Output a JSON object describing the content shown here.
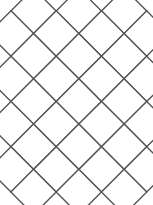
{
  "figure": {
    "title": "Diagonal diamond lattice tiling on a rectangle",
    "type": "geometric-diagram",
    "caption": "",
    "width": 153,
    "height": 205,
    "background_color": "#ffffff"
  },
  "colors": {
    "tile_fill": "#ffffff",
    "field_fill": "#d6d6d4",
    "stroke": "#555553",
    "outline": "#4a4a48",
    "page_background": "#ffffff"
  },
  "geometry": {
    "rect": {
      "x": 11,
      "y": 11,
      "width": 131,
      "height": 181
    },
    "lattice": {
      "pitch": 45.3,
      "half": 22.65,
      "rotation_deg": 45,
      "origin_x": 33.5,
      "origin_y": 33.5,
      "columns": 3,
      "rows": 4,
      "stroke_width": 1.4
    },
    "outline_stroke_width": 1.6
  },
  "chart_data": {
    "type": "diagram",
    "title": "Diagonal diamond lattice tiling on a rectangle",
    "shape": "rectangle",
    "tiling": "square tiles rotated 45 degrees",
    "tile_pitch_px": 45.3,
    "tile_side_px": 32,
    "full_tiles_interior": 6,
    "edge_notch_counts": {
      "top": 3,
      "bottom": 3,
      "left": 4,
      "right": 4
    },
    "fill_legend": [
      {
        "name": "tile",
        "color": "#ffffff",
        "label": "white diamond tile"
      },
      {
        "name": "field",
        "color": "#d6d6d4",
        "label": "gray background field"
      }
    ],
    "grid": false,
    "legend_position": "none",
    "annotations": []
  },
  "tiles": [
    {
      "cx": 33.5,
      "cy": 11.0
    },
    {
      "cx": 78.8,
      "cy": 11.0
    },
    {
      "cx": 124.1,
      "cy": 11.0
    },
    {
      "cx": 11.0,
      "cy": 33.5
    },
    {
      "cx": 56.2,
      "cy": 33.5
    },
    {
      "cx": 101.5,
      "cy": 33.5
    },
    {
      "cx": 146.7,
      "cy": 33.5
    },
    {
      "cx": 33.5,
      "cy": 56.2
    },
    {
      "cx": 78.8,
      "cy": 56.2
    },
    {
      "cx": 124.1,
      "cy": 56.2
    },
    {
      "cx": 11.0,
      "cy": 78.8
    },
    {
      "cx": 56.2,
      "cy": 78.8
    },
    {
      "cx": 101.5,
      "cy": 78.8
    },
    {
      "cx": 146.7,
      "cy": 78.8
    },
    {
      "cx": 33.5,
      "cy": 101.5
    },
    {
      "cx": 78.8,
      "cy": 101.5
    },
    {
      "cx": 124.1,
      "cy": 101.5
    },
    {
      "cx": 11.0,
      "cy": 124.1
    },
    {
      "cx": 56.2,
      "cy": 124.1
    },
    {
      "cx": 101.5,
      "cy": 124.1
    },
    {
      "cx": 146.7,
      "cy": 124.1
    },
    {
      "cx": 33.5,
      "cy": 146.7
    },
    {
      "cx": 78.8,
      "cy": 146.7
    },
    {
      "cx": 124.1,
      "cy": 146.7
    },
    {
      "cx": 11.0,
      "cy": 169.4
    },
    {
      "cx": 56.2,
      "cy": 169.4
    },
    {
      "cx": 101.5,
      "cy": 169.4
    },
    {
      "cx": 146.7,
      "cy": 169.4
    },
    {
      "cx": 33.5,
      "cy": 192.0
    },
    {
      "cx": 78.8,
      "cy": 192.0
    },
    {
      "cx": 124.1,
      "cy": 192.0
    }
  ]
}
